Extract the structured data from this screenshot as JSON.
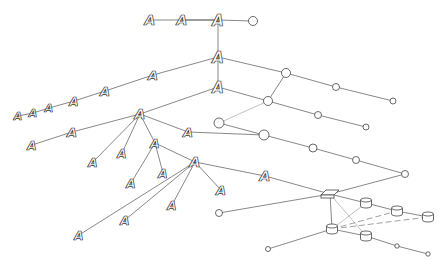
{
  "diagram": {
    "type": "network-topology",
    "node_glyph_label": "A",
    "colors": {
      "line": "#555555",
      "node_outline": "#333333",
      "background": "#ffffff"
    },
    "nodes": [
      {
        "id": "a1",
        "kind": "host",
        "x": 150,
        "y": 20,
        "size": 14
      },
      {
        "id": "a2",
        "kind": "host",
        "x": 182,
        "y": 20,
        "size": 14
      },
      {
        "id": "a3",
        "kind": "host",
        "x": 218,
        "y": 20,
        "size": 15
      },
      {
        "id": "h0",
        "kind": "hub",
        "x": 253,
        "y": 21,
        "r": 4.5
      },
      {
        "id": "a4",
        "kind": "host",
        "x": 218,
        "y": 57,
        "size": 15
      },
      {
        "id": "a5",
        "kind": "host",
        "x": 153,
        "y": 75,
        "size": 13
      },
      {
        "id": "a6",
        "kind": "host",
        "x": 105,
        "y": 91,
        "size": 13
      },
      {
        "id": "a7",
        "kind": "host",
        "x": 74,
        "y": 101,
        "size": 12
      },
      {
        "id": "a8",
        "kind": "host",
        "x": 49,
        "y": 108,
        "size": 11
      },
      {
        "id": "a9",
        "kind": "host",
        "x": 33,
        "y": 113,
        "size": 11
      },
      {
        "id": "a10",
        "kind": "host",
        "x": 18,
        "y": 116,
        "size": 11
      },
      {
        "id": "a11",
        "kind": "host",
        "x": 218,
        "y": 87,
        "size": 15
      },
      {
        "id": "a12",
        "kind": "host",
        "x": 140,
        "y": 114,
        "size": 14
      },
      {
        "id": "a13",
        "kind": "host",
        "x": 72,
        "y": 132,
        "size": 13
      },
      {
        "id": "a14",
        "kind": "host",
        "x": 32,
        "y": 145,
        "size": 12
      },
      {
        "id": "a15",
        "kind": "host",
        "x": 188,
        "y": 132,
        "size": 13
      },
      {
        "id": "a16",
        "kind": "host",
        "x": 93,
        "y": 162,
        "size": 12
      },
      {
        "id": "a17",
        "kind": "host",
        "x": 122,
        "y": 153,
        "size": 12
      },
      {
        "id": "a18",
        "kind": "host",
        "x": 155,
        "y": 143,
        "size": 12
      },
      {
        "id": "a19",
        "kind": "host",
        "x": 131,
        "y": 183,
        "size": 12
      },
      {
        "id": "a20",
        "kind": "host",
        "x": 163,
        "y": 173,
        "size": 12
      },
      {
        "id": "a21",
        "kind": "host",
        "x": 195,
        "y": 162,
        "size": 14
      },
      {
        "id": "a22",
        "kind": "host",
        "x": 79,
        "y": 235,
        "size": 12
      },
      {
        "id": "a23",
        "kind": "host",
        "x": 125,
        "y": 220,
        "size": 12
      },
      {
        "id": "a24",
        "kind": "host",
        "x": 172,
        "y": 205,
        "size": 12
      },
      {
        "id": "a25",
        "kind": "host",
        "x": 221,
        "y": 190,
        "size": 13
      },
      {
        "id": "a26",
        "kind": "host",
        "x": 265,
        "y": 176,
        "size": 14
      },
      {
        "id": "c1",
        "kind": "hub",
        "x": 286,
        "y": 73,
        "r": 4.5
      },
      {
        "id": "c2",
        "kind": "hub",
        "x": 336,
        "y": 87,
        "r": 3.5
      },
      {
        "id": "c3",
        "kind": "hub",
        "x": 393,
        "y": 101,
        "r": 3
      },
      {
        "id": "c4",
        "kind": "hub",
        "x": 268,
        "y": 101,
        "r": 4.5
      },
      {
        "id": "c5",
        "kind": "hub",
        "x": 318,
        "y": 115,
        "r": 3.5
      },
      {
        "id": "c6",
        "kind": "hub",
        "x": 366,
        "y": 127,
        "r": 3
      },
      {
        "id": "c7",
        "kind": "hub",
        "x": 219,
        "y": 123,
        "r": 5
      },
      {
        "id": "c8",
        "kind": "hub",
        "x": 264,
        "y": 135,
        "r": 5
      },
      {
        "id": "c9",
        "kind": "hub",
        "x": 313,
        "y": 148,
        "r": 4
      },
      {
        "id": "c10",
        "kind": "hub",
        "x": 356,
        "y": 160,
        "r": 3.5
      },
      {
        "id": "c11",
        "kind": "hub",
        "x": 405,
        "y": 174,
        "r": 3.5
      },
      {
        "id": "c12",
        "kind": "hub",
        "x": 219,
        "y": 213,
        "r": 3.5
      },
      {
        "id": "c13",
        "kind": "hub",
        "x": 268,
        "y": 249,
        "r": 2.5
      },
      {
        "id": "c14",
        "kind": "hub",
        "x": 397,
        "y": 246,
        "r": 2.2
      },
      {
        "id": "c15",
        "kind": "hub",
        "x": 428,
        "y": 254,
        "r": 2.2
      },
      {
        "id": "sw",
        "kind": "switch",
        "x": 330,
        "y": 194
      },
      {
        "id": "d1",
        "kind": "disk",
        "x": 366,
        "y": 203
      },
      {
        "id": "d2",
        "kind": "disk",
        "x": 397,
        "y": 211
      },
      {
        "id": "d3",
        "kind": "disk",
        "x": 428,
        "y": 217
      },
      {
        "id": "d4",
        "kind": "disk",
        "x": 332,
        "y": 229
      },
      {
        "id": "d5",
        "kind": "disk",
        "x": 366,
        "y": 236
      }
    ],
    "edges": [
      [
        "a1",
        "a2",
        "solid"
      ],
      [
        "a2",
        "a3",
        "solid"
      ],
      [
        "a2",
        "a3",
        "solid"
      ],
      [
        "a3",
        "h0",
        "solid"
      ],
      [
        "a3",
        "a4",
        "solid"
      ],
      [
        "a4",
        "a5",
        "solid"
      ],
      [
        "a5",
        "a6",
        "solid"
      ],
      [
        "a6",
        "a7",
        "solid"
      ],
      [
        "a7",
        "a8",
        "solid"
      ],
      [
        "a8",
        "a9",
        "solid"
      ],
      [
        "a9",
        "a10",
        "solid"
      ],
      [
        "a4",
        "a11",
        "solid"
      ],
      [
        "a4",
        "c1",
        "solid"
      ],
      [
        "c1",
        "c2",
        "solid"
      ],
      [
        "c2",
        "c3",
        "solid"
      ],
      [
        "a11",
        "a12",
        "solid"
      ],
      [
        "a12",
        "a13",
        "solid"
      ],
      [
        "a13",
        "a14",
        "solid"
      ],
      [
        "a11",
        "c4",
        "solid"
      ],
      [
        "c4",
        "c5",
        "solid"
      ],
      [
        "c5",
        "c6",
        "solid"
      ],
      [
        "c1",
        "c4",
        "solid"
      ],
      [
        "c4",
        "c7",
        "light"
      ],
      [
        "c7",
        "c8",
        "solid"
      ],
      [
        "a15",
        "c8",
        "solid"
      ],
      [
        "c8",
        "c9",
        "solid"
      ],
      [
        "c9",
        "c10",
        "solid"
      ],
      [
        "c10",
        "c11",
        "solid"
      ],
      [
        "a12",
        "a15",
        "solid"
      ],
      [
        "a12",
        "a16",
        "solid"
      ],
      [
        "a12",
        "a17",
        "solid"
      ],
      [
        "a12",
        "a18",
        "solid"
      ],
      [
        "a18",
        "a19",
        "solid"
      ],
      [
        "a18",
        "a20",
        "solid"
      ],
      [
        "a18",
        "a21",
        "solid"
      ],
      [
        "a21",
        "a22",
        "solid"
      ],
      [
        "a21",
        "a23",
        "solid"
      ],
      [
        "a21",
        "a24",
        "solid"
      ],
      [
        "a21",
        "a25",
        "solid"
      ],
      [
        "a21",
        "a26",
        "solid"
      ],
      [
        "a26",
        "sw",
        "solid"
      ],
      [
        "sw",
        "c11",
        "solid"
      ],
      [
        "sw",
        "c12",
        "solid"
      ],
      [
        "sw",
        "d1",
        "solid"
      ],
      [
        "d1",
        "d2",
        "solid"
      ],
      [
        "d2",
        "d3",
        "solid"
      ],
      [
        "sw",
        "d4",
        "solid"
      ],
      [
        "sw",
        "d5",
        "light"
      ],
      [
        "d4",
        "d1",
        "light"
      ],
      [
        "d4",
        "d2",
        "dash"
      ],
      [
        "d4",
        "d3",
        "dash"
      ],
      [
        "d4",
        "d5",
        "solid"
      ],
      [
        "d4",
        "c13",
        "solid"
      ],
      [
        "d5",
        "c14",
        "solid"
      ],
      [
        "c14",
        "c15",
        "solid"
      ]
    ]
  }
}
